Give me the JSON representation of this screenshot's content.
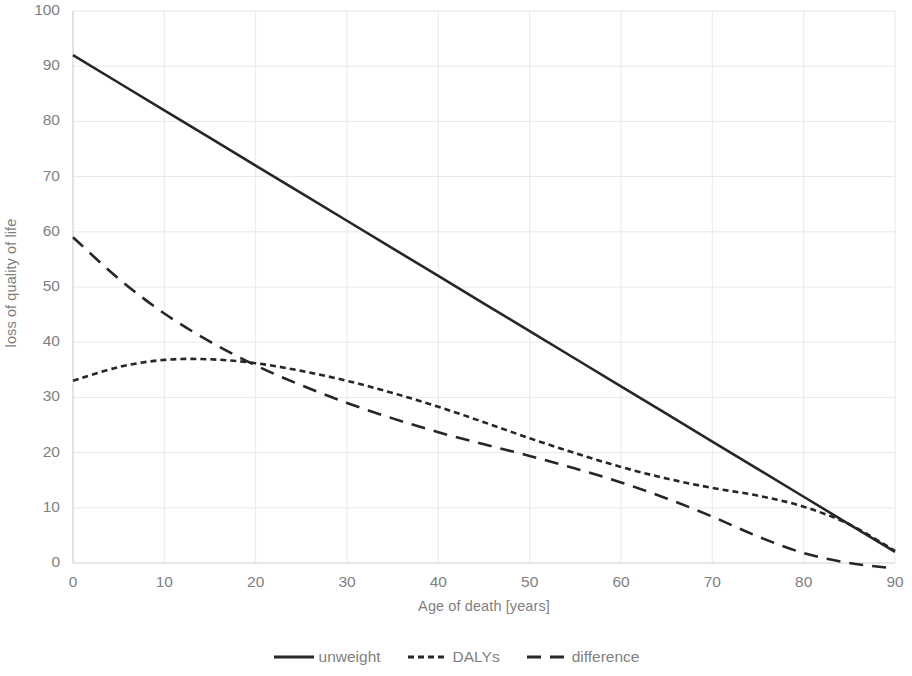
{
  "chart_data": {
    "type": "line",
    "title": "",
    "xlabel": "Age of death [years]",
    "ylabel": "loss of quality of life",
    "xlim": [
      0,
      90
    ],
    "ylim": [
      0,
      100
    ],
    "xticks": [
      0,
      10,
      20,
      30,
      40,
      50,
      60,
      70,
      80,
      90
    ],
    "yticks": [
      0,
      10,
      20,
      30,
      40,
      50,
      60,
      70,
      80,
      90,
      100
    ],
    "grid": true,
    "legend_position": "bottom",
    "x": [
      0,
      5,
      10,
      15,
      20,
      25,
      30,
      35,
      40,
      45,
      50,
      55,
      60,
      65,
      70,
      75,
      80,
      85,
      90
    ],
    "series": [
      {
        "name": "unweight",
        "style": "solid",
        "color": "#262626",
        "values": [
          92,
          87,
          82,
          77,
          72,
          67,
          62,
          57,
          52,
          47,
          42,
          37,
          32,
          27,
          22,
          17,
          12,
          7,
          2
        ]
      },
      {
        "name": "DALYs",
        "style": "dotted",
        "color": "#262626",
        "values": [
          33,
          35.5,
          36.8,
          36.9,
          36.2,
          34.8,
          33.0,
          30.8,
          28.3,
          25.5,
          22.6,
          19.9,
          17.4,
          15.3,
          13.6,
          12.2,
          10.2,
          7.0,
          2.2
        ]
      },
      {
        "name": "difference",
        "style": "dashed",
        "color": "#262626",
        "values": [
          59,
          51.5,
          45.2,
          40.1,
          35.8,
          32.2,
          29.0,
          26.2,
          23.7,
          21.5,
          19.4,
          17.1,
          14.6,
          11.7,
          8.4,
          4.8,
          1.8,
          0.0,
          -1.0
        ]
      }
    ]
  },
  "legend": {
    "items": [
      {
        "label": "unweight",
        "icon": "solid-line-swatch"
      },
      {
        "label": "DALYs",
        "icon": "dotted-line-swatch"
      },
      {
        "label": "difference",
        "icon": "dashed-line-swatch"
      }
    ]
  }
}
